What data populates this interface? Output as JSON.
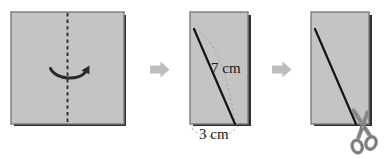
{
  "figure": {
    "background_color": "#ffffff",
    "paper_fill": "#c4c4c4",
    "paper_edge_color": "#7a7a7a",
    "paper_shadow_color": "#2b2b2b",
    "line_color": "#1a1a1a",
    "faint_arc_color": "#9a9a9a",
    "step_arrow_color": "#bdbdbd",
    "scissors_color": "#8f8f8f",
    "scissors_outline": "#6f6f6f"
  },
  "steps": [
    {
      "id": "step-1",
      "name": "fold-square",
      "shape": "square",
      "fold_line": "vertical-dashed-center",
      "action_icon": "curved-fold-arrow",
      "labels": []
    },
    {
      "id": "step-2",
      "name": "measure-folded-rectangle",
      "shape": "rectangle",
      "diagonal": "top-left-to-bottom-right",
      "labels": [
        {
          "name": "diagonal-length-label",
          "text": "7 cm",
          "x": 211,
          "y": 73
        },
        {
          "name": "base-length-label",
          "text": "3 cm",
          "x": 199,
          "y": 138
        }
      ],
      "guide_arc": "faint-dashed-arc"
    },
    {
      "id": "step-3",
      "name": "cut-along-diagonal",
      "shape": "rectangle",
      "diagonal": "top-left-to-bottom-right",
      "action_icon": "scissors-icon",
      "labels": []
    }
  ],
  "step_arrows": [
    {
      "name": "step-arrow-1-to-2",
      "x": 150,
      "y": 69
    },
    {
      "name": "step-arrow-2-to-3",
      "x": 272,
      "y": 69
    }
  ]
}
